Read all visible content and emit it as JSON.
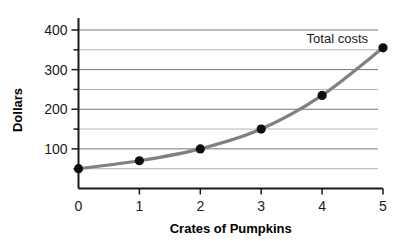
{
  "chart_data": {
    "type": "line",
    "title": "",
    "xlabel": "Crates of Pumpkins",
    "ylabel": "Dollars",
    "x": [
      0,
      1,
      2,
      3,
      4,
      5
    ],
    "values": [
      50,
      70,
      100,
      150,
      235,
      355
    ],
    "series": [
      {
        "name": "Total costs",
        "x": [
          0,
          1,
          2,
          3,
          4,
          5
        ],
        "values": [
          50,
          70,
          100,
          150,
          235,
          355
        ]
      }
    ],
    "annotations": [
      {
        "text": "Total costs",
        "x": 5,
        "y": 390
      }
    ],
    "xlim": [
      0,
      5
    ],
    "ylim": [
      0,
      420
    ],
    "xticks": [
      0,
      1,
      2,
      3,
      4,
      5
    ],
    "xtick_labels": [
      "0",
      "1",
      "2",
      "3",
      "4",
      "5"
    ],
    "yticks": [
      50,
      100,
      150,
      200,
      250,
      300,
      350,
      400
    ],
    "ytick_labels": [
      "",
      "100",
      "",
      "200",
      "",
      "300",
      "",
      "400"
    ],
    "ytick_major": [
      100,
      200,
      300,
      400
    ],
    "ytick_minor": [
      50,
      150,
      250,
      350
    ],
    "grid": true,
    "grid_axis": "y",
    "legend": false,
    "legend_position": "none",
    "colors": {
      "background": "#ffffff",
      "line": "#808080",
      "marker": "#0d0d0d",
      "axis": "#1a1a1a",
      "grid_major": "#767676",
      "grid_minor": "#b4b4b4",
      "text": "#1a1a1a"
    },
    "style": {
      "line_width": 3.2,
      "marker_radius": 4.6,
      "marker_shape": "circle",
      "curve": "smooth"
    }
  }
}
